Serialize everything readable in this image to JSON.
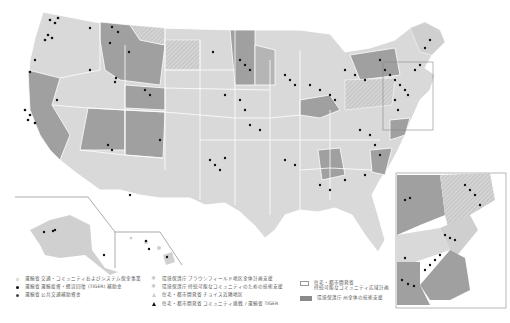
{
  "map": {
    "title": "",
    "colors": {
      "state_light": "#d9d9d9",
      "state_dark": "#9b9b9b",
      "state_hatched": "#c8c8c8",
      "border": "#ffffff",
      "inset_frame": "#888888",
      "point_black": "#111111",
      "point_gray": "#555555"
    },
    "insets": [
      "alaska",
      "hawaii",
      "northeast-corridor"
    ]
  },
  "legend": {
    "col1": [
      {
        "symbol": "light-square",
        "label": "運輸省 交通・コミュニティおよびシステム保全事業"
      },
      {
        "symbol": "black-dot",
        "label": "運輸省 運輸投資・経済回復 (TIGER) 補助金"
      },
      {
        "symbol": "dark-dot",
        "label": "運輸省 公共交通補助資金"
      }
    ],
    "col2": [
      {
        "symbol": "star",
        "label": "環境保護庁 ブラウンフィールド地区全体計画支援"
      },
      {
        "symbol": "star",
        "label": "環境保護庁 持続可能なコミュニティのための技術支援"
      },
      {
        "symbol": "light-triangle",
        "label": "住宅・都市開発省 チョイス近隣地区"
      },
      {
        "symbol": "black-triangle",
        "label": "住宅・都市開発省 コミュニティ挑戦 / 運輸省 TIGER"
      }
    ],
    "col3": [
      {
        "symbol": "outline-box",
        "label": "住宅・都市開発省",
        "label2": "持続可能なコミュニティ広域計画"
      },
      {
        "symbol": "filled-box",
        "label": "環境保護庁 州全体の技術支援"
      }
    ]
  }
}
